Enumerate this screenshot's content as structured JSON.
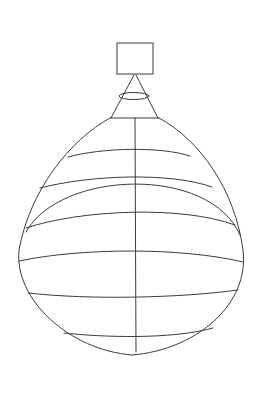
{
  "drawing": {
    "subject": "line sketch of a balloon / onion-dome shape",
    "stroke_color": "#3a3a3a",
    "background": "#ffffff",
    "parts": [
      "top-square",
      "cone",
      "cone-ring",
      "body-outline",
      "inner-arc",
      "center-axis",
      "horizontal-bands"
    ]
  }
}
